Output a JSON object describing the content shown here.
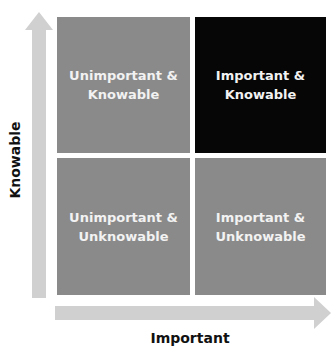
{
  "diagram": {
    "type": "2x2 matrix",
    "colors": {
      "quadrant_gray": "#8a8a8a",
      "quadrant_highlight": "#060606",
      "arrow": "#d0d0d0",
      "quadrant_text": "#f2f2f2",
      "axis_text": "#111111"
    },
    "y_axis": {
      "label": "Knowable",
      "icon": "arrow-up-icon"
    },
    "x_axis": {
      "label": "Important",
      "icon": "arrow-right-icon"
    },
    "quadrants": {
      "top_left": {
        "line1": "Unimportant &",
        "line2": "Knowable",
        "highlight": false
      },
      "top_right": {
        "line1": "Important &",
        "line2": "Knowable",
        "highlight": true
      },
      "bottom_left": {
        "line1": "Unimportant &",
        "line2": "Unknowable",
        "highlight": false
      },
      "bottom_right": {
        "line1": "Important &",
        "line2": "Unknowable",
        "highlight": false
      }
    }
  }
}
